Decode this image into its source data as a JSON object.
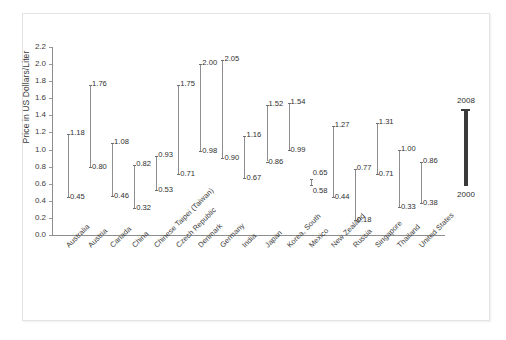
{
  "chart_data": {
    "type": "line",
    "title": "",
    "xlabel": "",
    "ylabel": "Price in US Dollars/Liter",
    "ylim": [
      0.0,
      2.2
    ],
    "yticks": [
      "0.0",
      "0.2",
      "0.4",
      "0.6",
      "0.8",
      "1.0",
      "1.2",
      "1.4",
      "1.6",
      "1.8",
      "2.0",
      "2.2"
    ],
    "grid": false,
    "legend_position": "right",
    "categories": [
      "Australia",
      "Austria",
      "Canada",
      "China",
      "Chinese Taipei (Taiwan)",
      "Czech Republic",
      "Denmark",
      "Germany",
      "India",
      "Japan",
      "Korea, South",
      "Mexico",
      "New Zealand",
      "Russia",
      "Singapore",
      "Thailand",
      "United States"
    ],
    "series": [
      {
        "name": "2000",
        "values": [
          0.45,
          0.8,
          0.46,
          0.32,
          0.53,
          0.71,
          0.98,
          0.9,
          0.67,
          0.86,
          0.99,
          0.58,
          0.44,
          0.18,
          0.71,
          0.33,
          0.38
        ]
      },
      {
        "name": "2008",
        "values": [
          1.18,
          1.76,
          1.08,
          0.82,
          0.93,
          1.75,
          2.0,
          2.05,
          1.16,
          1.52,
          1.54,
          0.65,
          1.27,
          0.77,
          1.31,
          1.0,
          0.86
        ]
      }
    ],
    "point_labels": {
      "2000": [
        "0.45",
        "0.80",
        "0.46",
        "0.32",
        "0.53",
        "0.71",
        "0.98",
        "0.90",
        "0.67",
        "0.86",
        "0.99",
        "0.58",
        "0.44",
        "0.18",
        "0.71",
        "0.33",
        "0.38"
      ],
      "2008": [
        "1.18",
        "1.76",
        "1.08",
        "0.82",
        "0.93",
        "1.75",
        "2.00",
        "2.05",
        "1.16",
        "1.52",
        "1.54",
        "0.65",
        "1.27",
        "0.77",
        "1.31",
        "1.00",
        "0.86"
      ]
    }
  },
  "legend": {
    "top_label": "2008",
    "bottom_label": "2000"
  }
}
